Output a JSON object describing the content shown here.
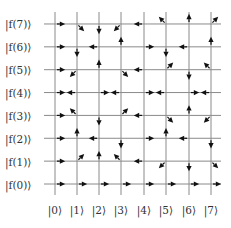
{
  "diagram": {
    "row_labels": [
      "|f(0)⟩",
      "|f(1)⟩",
      "|f(2)⟩",
      "|f(3)⟩",
      "|f(4)⟩",
      "|f(5)⟩",
      "|f(6)⟩",
      "|f(7)⟩"
    ],
    "col_labels": [
      "|0⟩",
      "|1⟩",
      "|2⟩",
      "|3⟩",
      "|4⟩",
      "|5⟩",
      "|6⟩",
      "|7⟩"
    ],
    "arrows_by_row": {
      "7": [
        "E",
        "SE",
        "S",
        "SW",
        "W",
        "NW",
        "N",
        "NE"
      ],
      "6": [
        "E",
        "S",
        "W",
        "N",
        "E",
        "S",
        "W",
        "N"
      ],
      "5": [
        "E",
        "SW",
        "N",
        "SE",
        "W",
        "NE",
        "S",
        "NW"
      ],
      "4": [
        "E",
        "W",
        "E",
        "W",
        "E",
        "W",
        "E",
        "W"
      ],
      "3": [
        "E",
        "NW",
        "S",
        "NE",
        "W",
        "SE",
        "N",
        "SW"
      ],
      "2": [
        "E",
        "N",
        "W",
        "S",
        "E",
        "N",
        "W",
        "S"
      ],
      "1": [
        "E",
        "NE",
        "N",
        "NW",
        "W",
        "SW",
        "S",
        "SE"
      ],
      "0": [
        "E",
        "E",
        "E",
        "E",
        "E",
        "E",
        "E",
        "E"
      ]
    },
    "colors": {
      "line": "#8a8a8a",
      "arrow": "#111111",
      "text": "#333333"
    }
  }
}
